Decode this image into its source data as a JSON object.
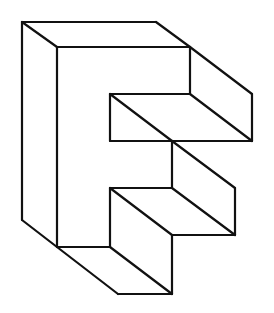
{
  "figure": {
    "stroke_color": "#111111",
    "background": "#ffffff",
    "edges": [
      [
        22,
        22,
        156,
        22
      ],
      [
        22,
        22,
        57,
        47
      ],
      [
        156,
        22,
        190,
        47
      ],
      [
        57,
        47,
        190,
        47
      ],
      [
        190,
        47,
        190,
        94
      ],
      [
        190,
        47,
        252,
        94
      ],
      [
        252,
        94,
        252,
        141
      ],
      [
        110,
        94,
        190,
        94
      ],
      [
        110,
        94,
        110,
        141
      ],
      [
        110,
        141,
        252,
        141
      ],
      [
        110,
        94,
        172,
        141
      ],
      [
        190,
        94,
        252,
        141
      ],
      [
        22,
        22,
        22,
        220
      ],
      [
        57,
        47,
        57,
        247
      ],
      [
        22,
        220,
        57,
        247
      ],
      [
        172,
        141,
        172,
        188
      ],
      [
        172,
        141,
        235,
        188
      ],
      [
        110,
        188,
        172,
        188
      ],
      [
        110,
        188,
        110,
        247
      ],
      [
        110,
        188,
        172,
        235
      ],
      [
        172,
        188,
        235,
        235
      ],
      [
        235,
        188,
        235,
        235
      ],
      [
        172,
        235,
        235,
        235
      ],
      [
        172,
        235,
        172,
        294
      ],
      [
        57,
        247,
        110,
        247
      ],
      [
        57,
        247,
        118,
        294
      ],
      [
        110,
        247,
        172,
        294
      ],
      [
        118,
        294,
        172,
        294
      ]
    ]
  }
}
